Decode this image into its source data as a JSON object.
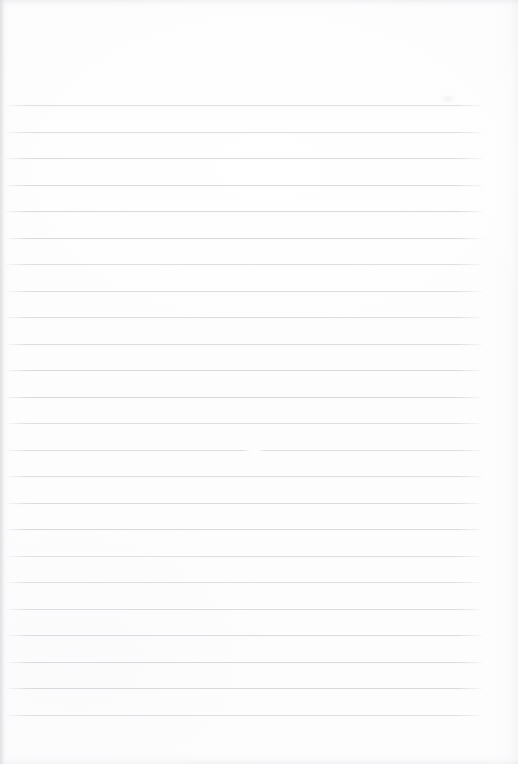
{
  "document": {
    "kind": "scanned-lined-paper",
    "title": "Blank ruled notebook page",
    "written_content": "",
    "page_width": 518,
    "page_height": 764,
    "background_color": "#fdfdfe",
    "rule_color": "#d9d9de",
    "edge_shadow_color": "#e2e2e6"
  },
  "ruling": {
    "line_count": 24,
    "first_line_y": 105,
    "line_spacing": 26.5,
    "line_thickness": 1,
    "line_start_x": 3,
    "line_end_x": 482,
    "lines_y": [
      105,
      131.5,
      158,
      184.5,
      211,
      237.5,
      264,
      290.5,
      317,
      343.5,
      370,
      396.5,
      423,
      449.5,
      476,
      502.5,
      529,
      555.5,
      582,
      608.5,
      635,
      661.5,
      688,
      714.5
    ],
    "top_margin_label": "blank header area above first rule",
    "bottom_margin_label": "blank footer area below last rule"
  },
  "artifacts": {
    "top_edge_band": "faint gray scan band across top edge",
    "bottom_edge_band": "faint gray scan band across bottom edge",
    "left_binding_strip": "darker vertical strip at far-left edge",
    "rule_break": {
      "line_index": 13,
      "x": 243,
      "width": 22
    },
    "smudge": {
      "x": 440,
      "y": 94,
      "width": 16,
      "height": 10
    }
  }
}
